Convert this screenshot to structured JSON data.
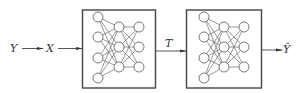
{
  "diagram": {
    "type": "pipeline",
    "labels": {
      "input": "Y",
      "encoded": "X",
      "intermediate": "T",
      "output": "Ŷ"
    },
    "blocks": [
      {
        "name": "network-1",
        "layers": [
          4,
          3,
          3
        ]
      },
      {
        "name": "network-2",
        "layers": [
          4,
          3,
          3
        ]
      }
    ],
    "flow": [
      "Y",
      "X",
      "network-1",
      "T",
      "network-2",
      "Ŷ"
    ]
  }
}
